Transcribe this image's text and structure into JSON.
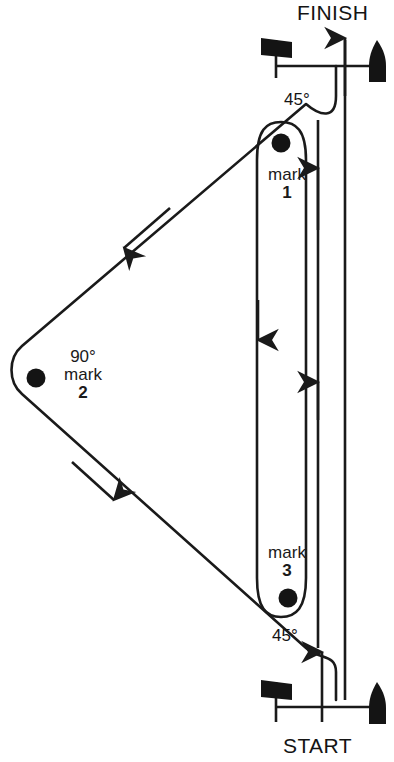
{
  "diagram": {
    "title_top": "FINISH",
    "title_bottom": "START",
    "type": "sailing-race-course",
    "line_color": "#1a1a1a",
    "fill_color": "#111111",
    "background": "#ffffff"
  },
  "endpoints": {
    "finish": {
      "label": "FINISH",
      "flag_icon": "race-flag-icon",
      "buoy_icon": "buoy-icon",
      "arrow_icon": "arrow-up-icon"
    },
    "start": {
      "label": "START",
      "flag_icon": "race-flag-icon",
      "buoy_icon": "buoy-icon",
      "arrow_icon": "arrow-up-icon"
    }
  },
  "marks": [
    {
      "name": "mark-1",
      "word": "mark",
      "number": "1",
      "angle": "45°",
      "dot_icon": "mark-dot-icon"
    },
    {
      "name": "mark-2",
      "word": "mark",
      "number": "2",
      "angle": "90°",
      "dot_icon": "mark-dot-icon"
    },
    {
      "name": "mark-3",
      "word": "mark",
      "number": "3",
      "angle": "45°",
      "dot_icon": "mark-dot-icon"
    }
  ],
  "angles": {
    "top": "45°",
    "bottom": "45°",
    "left": "90°"
  },
  "route_arrows": [
    {
      "name": "arrow-upper-diagonal-down-left",
      "direction": "down-left"
    },
    {
      "name": "arrow-lower-diagonal-down-right",
      "direction": "down-right"
    },
    {
      "name": "arrow-inner-corridor-down",
      "direction": "down"
    },
    {
      "name": "arrow-inner-corridor-up",
      "direction": "up"
    },
    {
      "name": "arrow-mark1-approach-up",
      "direction": "up"
    },
    {
      "name": "arrow-start-up",
      "direction": "up"
    },
    {
      "name": "arrow-finish-up",
      "direction": "up"
    }
  ]
}
